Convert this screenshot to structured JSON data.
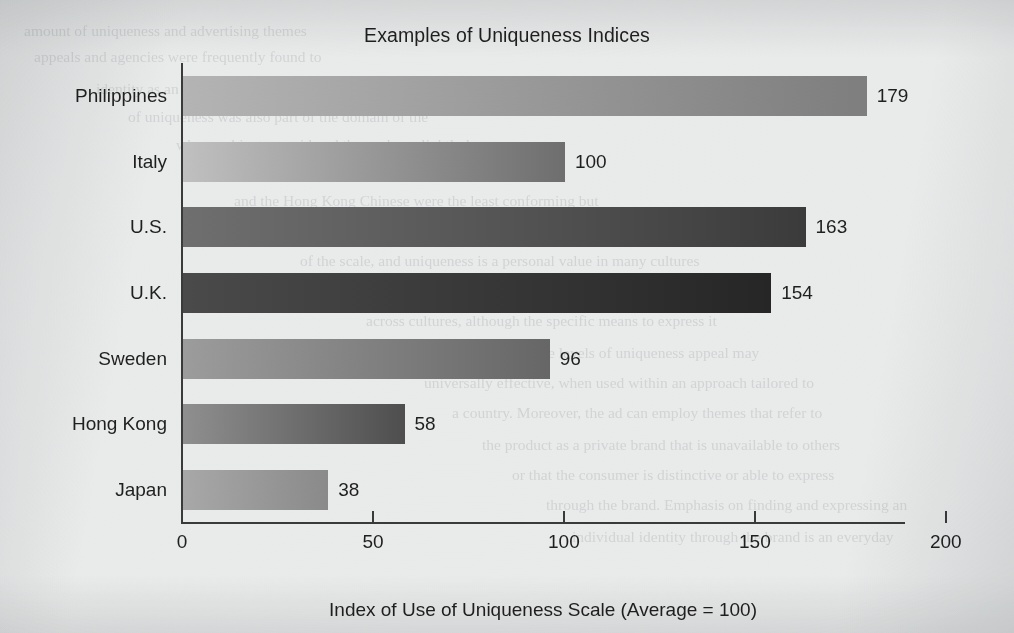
{
  "chart_data": {
    "type": "bar",
    "orientation": "horizontal",
    "title": "Examples of Uniqueness Indices",
    "xlabel": "Index of Use of Uniqueness Scale (Average = 100)",
    "ylabel": "",
    "categories": [
      "Philippines",
      "Italy",
      "U.S.",
      "U.K.",
      "Sweden",
      "Hong Kong",
      "Japan"
    ],
    "values": [
      179,
      100,
      163,
      154,
      96,
      58,
      38
    ],
    "value_labels": [
      "179",
      "100",
      "163",
      "154",
      "96",
      "58",
      "38"
    ],
    "xlim": [
      0,
      200
    ],
    "xticks": [
      0,
      50,
      100,
      150,
      200
    ],
    "xtick_labels": [
      "0",
      "50",
      "100",
      "150",
      "200"
    ],
    "grid": false,
    "legend": "none",
    "bar_styles": [
      {
        "category": "Philippines",
        "from": "#b4b4b4",
        "to": "#7e7e7e"
      },
      {
        "category": "Italy",
        "from": "#c0c0c0",
        "to": "#6e6e6e"
      },
      {
        "category": "U.S.",
        "from": "#6f6f6f",
        "to": "#3b3b3b"
      },
      {
        "category": "U.K.",
        "from": "#4a4a4a",
        "to": "#262626"
      },
      {
        "category": "Sweden",
        "from": "#9c9c9c",
        "to": "#666666"
      },
      {
        "category": "Hong Kong",
        "from": "#8f8f8f",
        "to": "#4e4e4e"
      },
      {
        "category": "Japan",
        "from": "#a8a8a8",
        "to": "#8a8a8a"
      }
    ]
  },
  "page": {
    "background_color": "#e9eaea",
    "axis_color": "#3a3a3a",
    "text_color": "#1f1f1f"
  },
  "ghost_text": {
    "lines": [
      "amount of uniqueness and advertising themes",
      "appeals and agencies were frequently found to",
      "identity as an important personal value. Table",
      "of uniqueness was also part of the domain of the",
      "where subjects considered themselves slightly less",
      "more conforming. The Japanese were the most",
      "and the Hong Kong Chinese were the least conforming but",
      "also reported relatively low uniqueness scores in the",
      "of the scale, and uniqueness is a personal value in many cultures",
      "was identified as a desirable attribute in advertising",
      "across cultures, although the specific means to express it",
      "across cultures. Moderate levels of uniqueness appeal may",
      "universally effective, when used within an approach tailored to",
      "a country. Moreover, the ad can employ themes that refer to",
      "the product as a private brand that is unavailable to others",
      "or that the consumer is distinctive or able to express",
      "through the brand. Emphasis on finding and expressing an",
      "individual identity through the brand is an everyday"
    ]
  }
}
